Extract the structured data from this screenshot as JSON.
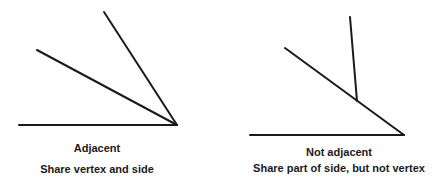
{
  "diagrams": [
    {
      "title": "Adjacent",
      "subtitle": "Share vertex and side",
      "lines": [
        {
          "x1": 19,
          "y1": 125,
          "x2": 177,
          "y2": 125
        },
        {
          "x1": 104,
          "y1": 12,
          "x2": 177,
          "y2": 125
        },
        {
          "x1": 37,
          "y1": 50,
          "x2": 177,
          "y2": 125
        }
      ]
    },
    {
      "title": "Not adjacent",
      "subtitle": "Share part of side, but not vertex",
      "lines": [
        {
          "x1": 250,
          "y1": 135,
          "x2": 404,
          "y2": 135
        },
        {
          "x1": 285,
          "y1": 48,
          "x2": 404,
          "y2": 135
        },
        {
          "x1": 350,
          "y1": 17,
          "x2": 357,
          "y2": 101
        }
      ]
    }
  ],
  "colors": {
    "line": "#1a1a1a",
    "text": "#1a1a1a",
    "background": "#ffffff"
  }
}
